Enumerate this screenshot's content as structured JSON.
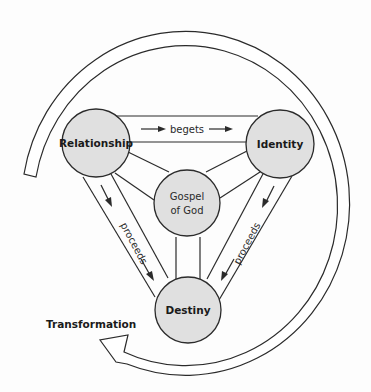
{
  "diagram": {
    "nodes": {
      "relationship": "Relationship",
      "identity": "Identity",
      "gospel_line1": "Gospel",
      "gospel_line2": "of God",
      "destiny": "Destiny"
    },
    "edges": {
      "top": "begets",
      "left": "proceeds",
      "right": "proceeds"
    },
    "cycle_label": "Transformation",
    "colors": {
      "node_fill": "#e0e0e0",
      "stroke": "#2b2b2b",
      "background": "#ffffff"
    }
  }
}
